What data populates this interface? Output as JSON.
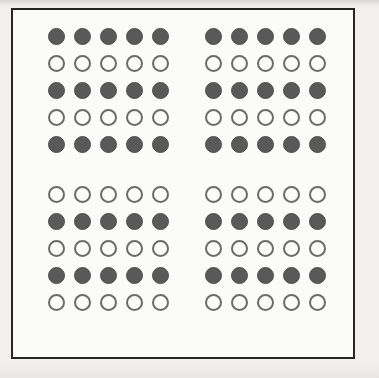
{
  "figure": {
    "columns_per_cluster": 5,
    "clusters_per_row": 2,
    "rows_total": 10,
    "colors": {
      "page_background": "#f1f0ee",
      "plate_background": "#fbfbfa",
      "frame_border": "#262626",
      "filled_circle": "#59595a",
      "open_circle_stroke": "#6b6b6c"
    },
    "legend": {
      "filled_label": "filled circle",
      "open_label": "open circle"
    },
    "groups": [
      {
        "name": "upper-group",
        "rows": [
          {
            "index": 1,
            "style": "filled",
            "clusters": [
              [
                "filled",
                "filled",
                "filled",
                "filled",
                "filled"
              ],
              [
                "filled",
                "filled",
                "filled",
                "filled",
                "filled"
              ]
            ]
          },
          {
            "index": 2,
            "style": "open",
            "clusters": [
              [
                "open",
                "open",
                "open",
                "open",
                "open"
              ],
              [
                "open",
                "open",
                "open",
                "open",
                "open"
              ]
            ]
          },
          {
            "index": 3,
            "style": "filled",
            "clusters": [
              [
                "filled",
                "filled",
                "filled",
                "filled",
                "filled"
              ],
              [
                "filled",
                "filled",
                "filled",
                "filled",
                "filled"
              ]
            ]
          },
          {
            "index": 4,
            "style": "open",
            "clusters": [
              [
                "open",
                "open",
                "open",
                "open",
                "open"
              ],
              [
                "open",
                "open",
                "open",
                "open",
                "open"
              ]
            ]
          },
          {
            "index": 5,
            "style": "filled",
            "clusters": [
              [
                "filled",
                "filled",
                "filled",
                "filled",
                "filled"
              ],
              [
                "filled",
                "filled",
                "filled",
                "filled",
                "filled"
              ]
            ]
          }
        ]
      },
      {
        "name": "lower-group",
        "rows": [
          {
            "index": 6,
            "style": "open",
            "clusters": [
              [
                "open",
                "open",
                "open",
                "open",
                "open"
              ],
              [
                "open",
                "open",
                "open",
                "open",
                "open"
              ]
            ]
          },
          {
            "index": 7,
            "style": "filled",
            "clusters": [
              [
                "filled",
                "filled",
                "filled",
                "filled",
                "filled"
              ],
              [
                "filled",
                "filled",
                "filled",
                "filled",
                "filled"
              ]
            ]
          },
          {
            "index": 8,
            "style": "open",
            "clusters": [
              [
                "open",
                "open",
                "open",
                "open",
                "open"
              ],
              [
                "open",
                "open",
                "open",
                "open",
                "open"
              ]
            ]
          },
          {
            "index": 9,
            "style": "filled",
            "clusters": [
              [
                "filled",
                "filled",
                "filled",
                "filled",
                "filled"
              ],
              [
                "filled",
                "filled",
                "filled",
                "filled",
                "filled"
              ]
            ]
          },
          {
            "index": 10,
            "style": "open",
            "clusters": [
              [
                "open",
                "open",
                "open",
                "open",
                "open"
              ],
              [
                "open",
                "open",
                "open",
                "open",
                "open"
              ]
            ]
          }
        ]
      }
    ]
  }
}
